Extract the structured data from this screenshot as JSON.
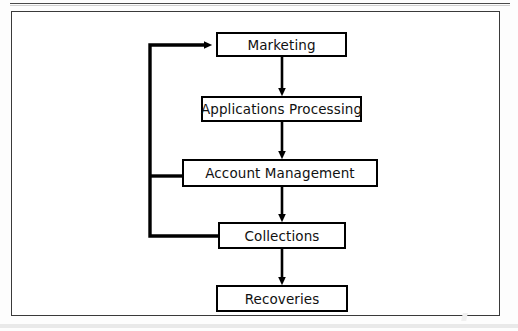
{
  "figure": {
    "type": "flowchart",
    "orientation": "vertical",
    "nodes": [
      {
        "id": "marketing",
        "label": "Marketing",
        "x": 215,
        "y": 31,
        "w": 131,
        "h": 25
      },
      {
        "id": "applications_processing",
        "label": "Applications Processing",
        "x": 200,
        "y": 95,
        "w": 161,
        "h": 26
      },
      {
        "id": "account_management",
        "label": "Account Management",
        "x": 181,
        "y": 158,
        "w": 196,
        "h": 28
      },
      {
        "id": "collections",
        "label": "Collections",
        "x": 217,
        "y": 221,
        "w": 128,
        "h": 27
      },
      {
        "id": "recoveries",
        "label": "Recoveries",
        "x": 215,
        "y": 284,
        "w": 132,
        "h": 27
      }
    ],
    "edges": [
      {
        "from": "marketing",
        "to": "applications_processing",
        "style": "arrow-down"
      },
      {
        "from": "applications_processing",
        "to": "account_management",
        "style": "arrow-down"
      },
      {
        "from": "account_management",
        "to": "collections",
        "style": "arrow-down"
      },
      {
        "from": "collections",
        "to": "recoveries",
        "style": "arrow-down"
      },
      {
        "from": "account_management",
        "to": "marketing",
        "style": "feedback-loop-left"
      },
      {
        "from": "collections",
        "to": "marketing",
        "style": "feedback-loop-left"
      }
    ],
    "colors": {
      "line": "#000000",
      "box_border": "#000000",
      "box_fill": "#ffffff",
      "frame_border": "#3a3a3a",
      "page_background": "#ffffff",
      "text": "#111111"
    }
  }
}
